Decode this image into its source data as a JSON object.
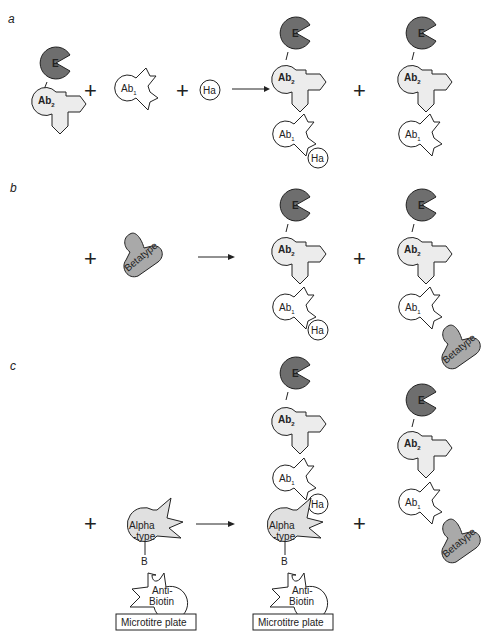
{
  "figure": {
    "panels": [
      {
        "id": "a",
        "label": "a",
        "reactants": [
          "E–Ab2 conjugate",
          "Ab1",
          "Ha"
        ],
        "products": [
          "E–Ab2–Ab1–Ha complex",
          "E–Ab2–Ab1 complex"
        ]
      },
      {
        "id": "b",
        "label": "b",
        "reactants": [
          "Betatype"
        ],
        "products": [
          "E–Ab2–Ab1–Ha complex",
          "E–Ab2–Ab1–Betatype complex"
        ]
      },
      {
        "id": "c",
        "label": "c",
        "reactants": [
          "Alpha-type–B bound to Anti-Biotin on Microtitre plate"
        ],
        "products": [
          "E–Ab2–Ab1–Ha–Alpha-type–B–Anti-Biotin on Microtitre plate",
          "E–Ab2–Ab1–Betatype complex"
        ]
      }
    ],
    "labels": {
      "enzyme": "E",
      "ab2_main": "Ab",
      "ab2_sub": "2",
      "ab1_main": "Ab",
      "ab1_sub": "1",
      "hapten": "Ha",
      "betatype": "Betatype",
      "alpha_line1": "Alpha",
      "alpha_line2": "-type",
      "biotin": "B",
      "antibiotin_line1": "Anti-",
      "antibiotin_line2": "Biotin",
      "plate": "Microtitre plate",
      "plus": "+"
    },
    "colors": {
      "enzyme": "#6e6e6e",
      "ab2": "#ececec",
      "ab1": "#ffffff",
      "betatype": "#a9a9a9",
      "alphatype": "#e0e0e0"
    }
  }
}
